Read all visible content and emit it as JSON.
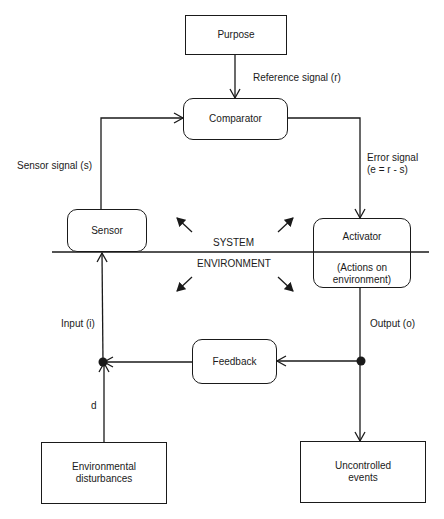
{
  "diagram": {
    "nodes": {
      "purpose": {
        "label": "Purpose"
      },
      "comparator": {
        "label": "Comparator"
      },
      "sensor": {
        "label": "Sensor"
      },
      "activator": {
        "label": "Activator",
        "sublabel_line1": "(Actions on",
        "sublabel_line2": "environment)"
      },
      "feedback": {
        "label": "Feedback"
      },
      "env_disturbances": {
        "line1": "Environmental",
        "line2": "disturbances"
      },
      "uncontrolled_events": {
        "line1": "Uncontrolled",
        "line2": "events"
      }
    },
    "edges": {
      "reference_signal": "Reference signal (r)",
      "sensor_signal": "Sensor signal (s)",
      "error_signal_line1": "Error signal",
      "error_signal_line2": "(e = r - s)",
      "input": "Input (i)",
      "output": "Output (o)",
      "disturbance": "d"
    },
    "regions": {
      "system": "SYSTEM",
      "environment": "ENVIRONMENT"
    },
    "colors": {
      "line": "#1a1a1a",
      "background": "#ffffff"
    }
  }
}
